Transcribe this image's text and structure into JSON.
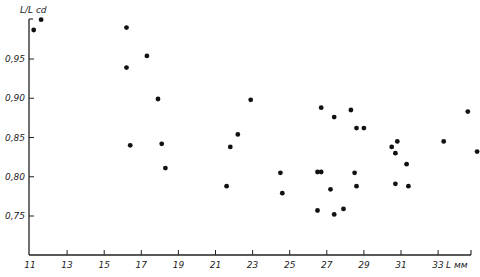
{
  "chart_data": {
    "type": "scatter",
    "title": "",
    "xlabel": "L мм",
    "ylabel": "L/L cd",
    "xlim": [
      11,
      35.5
    ],
    "ylim": [
      0.7,
      1.01
    ],
    "grid": false,
    "legend": null,
    "x_ticks": [
      11,
      13,
      15,
      17,
      19,
      21,
      23,
      25,
      27,
      29,
      31,
      33
    ],
    "x_tick_labels": [
      "11",
      "13",
      "15",
      "17",
      "19",
      "21",
      "23",
      "25",
      "27",
      "29",
      "31",
      "33"
    ],
    "y_ticks": [
      0.75,
      0.8,
      0.85,
      0.9,
      0.95
    ],
    "y_tick_labels": [
      "0,75",
      "0,80",
      "0,85",
      "0,90",
      "0,95"
    ],
    "series": [
      {
        "name": "observations",
        "color": "#111111",
        "points": [
          [
            11.2,
            0.987
          ],
          [
            11.6,
            1.0
          ],
          [
            16.2,
            0.99
          ],
          [
            16.2,
            0.939
          ],
          [
            17.3,
            0.954
          ],
          [
            17.9,
            0.899
          ],
          [
            16.4,
            0.84
          ],
          [
            18.1,
            0.842
          ],
          [
            18.3,
            0.811
          ],
          [
            22.9,
            0.898
          ],
          [
            22.2,
            0.854
          ],
          [
            21.8,
            0.838
          ],
          [
            24.5,
            0.805
          ],
          [
            21.6,
            0.788
          ],
          [
            24.6,
            0.779
          ],
          [
            26.7,
            0.888
          ],
          [
            28.3,
            0.885
          ],
          [
            27.4,
            0.876
          ],
          [
            28.6,
            0.862
          ],
          [
            29.0,
            0.862
          ],
          [
            26.5,
            0.806
          ],
          [
            26.7,
            0.806
          ],
          [
            28.5,
            0.805
          ],
          [
            27.2,
            0.784
          ],
          [
            28.6,
            0.788
          ],
          [
            26.5,
            0.757
          ],
          [
            27.4,
            0.752
          ],
          [
            27.9,
            0.759
          ],
          [
            30.8,
            0.845
          ],
          [
            30.5,
            0.838
          ],
          [
            30.7,
            0.83
          ],
          [
            31.3,
            0.816
          ],
          [
            30.7,
            0.791
          ],
          [
            31.4,
            0.788
          ],
          [
            33.3,
            0.845
          ],
          [
            34.6,
            0.883
          ],
          [
            35.1,
            0.832
          ]
        ]
      }
    ]
  },
  "layout": {
    "x_axis": {
      "x0_px": 30,
      "px_per_unit": 18.55,
      "base_value": 11,
      "baseline_y": 255,
      "end_x": 471
    },
    "y_axis": {
      "x_px": 29,
      "ref_value": 0.95,
      "ref_y": 59,
      "px_per_unit": 785,
      "top_y": 19
    }
  }
}
